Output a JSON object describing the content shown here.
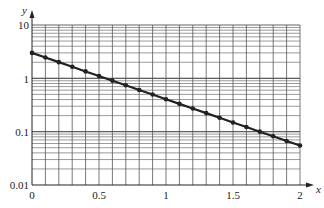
{
  "chart_data": {
    "type": "line",
    "title": "",
    "xlabel": "x",
    "ylabel": "y",
    "xscale": "linear",
    "yscale": "log",
    "xlim": [
      0,
      2
    ],
    "ylim": [
      0.01,
      10
    ],
    "grid": true,
    "x_ticks": [
      0,
      0.5,
      1,
      1.5,
      2
    ],
    "x_tick_labels": [
      "0",
      "0.5",
      "1",
      "1.5",
      "2"
    ],
    "y_ticks": [
      0.01,
      0.1,
      1,
      10
    ],
    "y_tick_labels": [
      "0.01",
      "0.1",
      "1",
      "10"
    ],
    "series": [
      {
        "name": "y = 3e^(-2x)",
        "marker": "circle",
        "color": "#222222",
        "x": [
          0,
          0.1,
          0.2,
          0.3,
          0.4,
          0.5,
          0.6,
          0.7,
          0.8,
          0.9,
          1.0,
          1.1,
          1.2,
          1.3,
          1.4,
          1.5,
          1.6,
          1.7,
          1.8,
          1.9,
          2.0
        ],
        "values": [
          3.0,
          2.456,
          2.011,
          1.646,
          1.348,
          1.104,
          0.904,
          0.74,
          0.606,
          0.496,
          0.406,
          0.332,
          0.272,
          0.223,
          0.182,
          0.149,
          0.122,
          0.1,
          0.082,
          0.067,
          0.055
        ]
      }
    ]
  },
  "labels": {
    "x_axis": "x",
    "y_axis": "y",
    "x_ticks": [
      "0",
      "0.5",
      "1",
      "1.5",
      "2"
    ],
    "y_ticks": [
      "0.01",
      "0.1",
      "1",
      "10"
    ]
  }
}
